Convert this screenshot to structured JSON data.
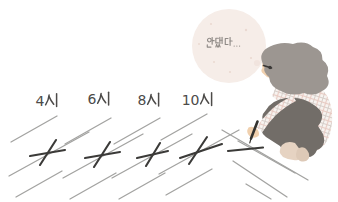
{
  "scene": {
    "background": "#ffffff",
    "thought_bubble": {
      "text": "안됐다...",
      "fill": "#f6ede8",
      "text_color": "#908b87"
    },
    "time_labels": [
      "4시",
      "6시",
      "8시",
      "10시"
    ],
    "label_color": "#4d4b49",
    "ground_line_color": "#a3a3a1",
    "marks": {
      "crossed_out_count": 4,
      "in_progress_count": 1,
      "color": "#3b3a38"
    },
    "person": {
      "alt": "woman crouching and drawing a mark on the ground",
      "hair_color": "#9c9691",
      "skin_color": "#f0d0ae",
      "feet_color": "#e6d3c2",
      "shirt_color": "#f8f4f1",
      "plaid_pink": "#e8cbc3",
      "plaid_gray": "#d6cec9",
      "pants_color": "#726d68",
      "pen_color": "#35332f",
      "glasses_color": "#3a3836"
    }
  }
}
